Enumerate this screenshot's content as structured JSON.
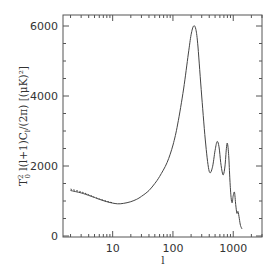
{
  "chart_data": {
    "type": "line",
    "title": "",
    "xlabel": "l",
    "ylabel": "T_0^2 l(l+1)C_l/(2π) [(μK)²]",
    "xscale": "log",
    "xlim": [
      1.5,
      3000
    ],
    "ylim": [
      0,
      6200
    ],
    "grid": false,
    "legend": null,
    "x_ticks": [
      10,
      100,
      1000
    ],
    "x_tick_labels": [
      "10",
      "100",
      "1000"
    ],
    "y_ticks": [
      0,
      2000,
      4000,
      6000
    ],
    "y_tick_labels": [
      "0",
      "2000",
      "4000",
      "6000"
    ],
    "series": [
      {
        "name": "CMB power spectrum (solid)",
        "style": "solid",
        "x": [
          2,
          3,
          4,
          5,
          6,
          8,
          10,
          12,
          15,
          20,
          25,
          30,
          40,
          50,
          60,
          80,
          100,
          120,
          150,
          180,
          200,
          220,
          240,
          260,
          300,
          350,
          400,
          450,
          500,
          540,
          580,
          620,
          660,
          690,
          730,
          770,
          800,
          840,
          880,
          920,
          960,
          1000,
          1050,
          1100,
          1150,
          1200,
          1260,
          1320,
          1400
        ],
        "y": [
          1300,
          1230,
          1160,
          1100,
          1050,
          980,
          940,
          920,
          930,
          980,
          1050,
          1130,
          1300,
          1500,
          1700,
          2100,
          2600,
          3200,
          4200,
          5200,
          5750,
          6000,
          5900,
          5400,
          4000,
          2600,
          1850,
          1950,
          2450,
          2700,
          2550,
          2100,
          1800,
          1760,
          2000,
          2500,
          2650,
          2300,
          1600,
          1100,
          950,
          1150,
          1250,
          900,
          650,
          700,
          500,
          300,
          200
        ]
      },
      {
        "name": "Dotted overlay (low l)",
        "style": "dotted",
        "x": [
          2,
          3,
          4,
          5,
          6,
          8,
          10
        ],
        "y": [
          1340,
          1260,
          1180,
          1110,
          1060,
          990,
          950
        ]
      }
    ]
  },
  "axes": {
    "x_title": "l",
    "y_title_parts": {
      "prefix": "T",
      "sup": "2",
      "sub": "0",
      "body": " l(l+1)C",
      "sub2": "l",
      "tail": "/(2π)  [(μK)²]"
    }
  }
}
